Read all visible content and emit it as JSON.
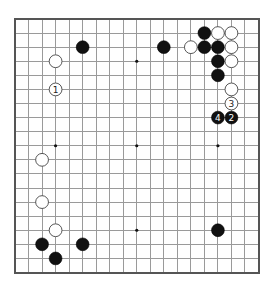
{
  "diagram": {
    "type": "go-board",
    "board_size": 19,
    "colors": {
      "background": "#ffffff",
      "grid": "#9a9a9a",
      "border": "#555555",
      "black_stone": "#111111",
      "white_stone": "#ffffff"
    },
    "star_points": [
      [
        3,
        3
      ],
      [
        9,
        3
      ],
      [
        15,
        3
      ],
      [
        3,
        9
      ],
      [
        9,
        9
      ],
      [
        15,
        9
      ],
      [
        3,
        15
      ],
      [
        9,
        15
      ],
      [
        15,
        15
      ]
    ],
    "stones": [
      {
        "color": "black",
        "col": 14,
        "row": 1,
        "label": ""
      },
      {
        "color": "white",
        "col": 15,
        "row": 1,
        "label": ""
      },
      {
        "color": "white",
        "col": 16,
        "row": 1,
        "label": ""
      },
      {
        "color": "black",
        "col": 5,
        "row": 2,
        "label": ""
      },
      {
        "color": "black",
        "col": 11,
        "row": 2,
        "label": ""
      },
      {
        "color": "white",
        "col": 13,
        "row": 2,
        "label": ""
      },
      {
        "color": "black",
        "col": 14,
        "row": 2,
        "label": ""
      },
      {
        "color": "black",
        "col": 15,
        "row": 2,
        "label": ""
      },
      {
        "color": "white",
        "col": 16,
        "row": 2,
        "label": ""
      },
      {
        "color": "white",
        "col": 3,
        "row": 3,
        "label": ""
      },
      {
        "color": "black",
        "col": 15,
        "row": 3,
        "label": ""
      },
      {
        "color": "white",
        "col": 16,
        "row": 3,
        "label": ""
      },
      {
        "color": "black",
        "col": 15,
        "row": 4,
        "label": ""
      },
      {
        "color": "white",
        "col": 3,
        "row": 5,
        "label": "1"
      },
      {
        "color": "white",
        "col": 16,
        "row": 5,
        "label": ""
      },
      {
        "color": "white",
        "col": 16,
        "row": 6,
        "label": "3"
      },
      {
        "color": "black",
        "col": 15,
        "row": 7,
        "label": "4"
      },
      {
        "color": "black",
        "col": 16,
        "row": 7,
        "label": "2"
      },
      {
        "color": "white",
        "col": 2,
        "row": 10,
        "label": ""
      },
      {
        "color": "white",
        "col": 2,
        "row": 13,
        "label": ""
      },
      {
        "color": "white",
        "col": 3,
        "row": 15,
        "label": ""
      },
      {
        "color": "black",
        "col": 15,
        "row": 15,
        "label": ""
      },
      {
        "color": "black",
        "col": 2,
        "row": 16,
        "label": ""
      },
      {
        "color": "black",
        "col": 5,
        "row": 16,
        "label": ""
      },
      {
        "color": "black",
        "col": 3,
        "row": 17,
        "label": ""
      }
    ],
    "move_sequence": [
      {
        "move": "1",
        "color": "white",
        "col": 3,
        "row": 5
      },
      {
        "move": "2",
        "color": "black",
        "col": 16,
        "row": 7
      },
      {
        "move": "3",
        "color": "white",
        "col": 16,
        "row": 6
      },
      {
        "move": "4",
        "color": "black",
        "col": 15,
        "row": 7
      }
    ]
  }
}
